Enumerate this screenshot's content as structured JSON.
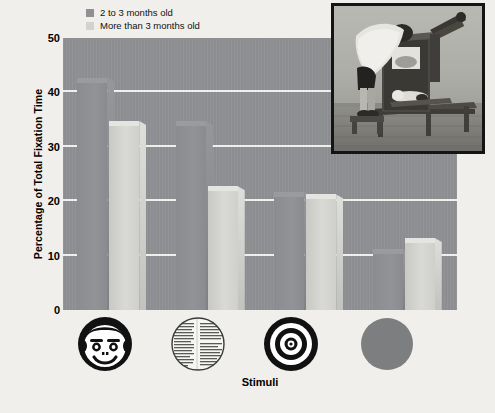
{
  "figure": {
    "background_color": "#f0efeb",
    "plot_background_color": "#8f9093"
  },
  "legend": {
    "position": "top-left-inside",
    "entries": [
      {
        "label": "2 to 3 months old",
        "color": "#8f9093",
        "swatch": "dark"
      },
      {
        "label": "More than 3 months old",
        "color": "#d2d2ce",
        "swatch": "light"
      }
    ]
  },
  "axes": {
    "ylabel": "Percentage of Total Fixation Time",
    "xlabel": "Stimuli",
    "yticks": [
      "0",
      "10",
      "20",
      "30",
      "40",
      "50"
    ],
    "ymin": 0,
    "ymax": 50,
    "grid": "horizontal"
  },
  "stimuli": [
    {
      "name": "face-stimulus",
      "icon": "schematic-face-icon",
      "caption": ""
    },
    {
      "name": "newsprint-stimulus",
      "icon": "newsprint-circle-icon",
      "caption": ""
    },
    {
      "name": "bullseye-stimulus",
      "icon": "bullseye-icon",
      "caption": ""
    },
    {
      "name": "plain-disc-stimulus",
      "icon": "plain-disc-icon",
      "caption": ""
    }
  ],
  "inset": {
    "name": "fantz-looking-chamber-photo",
    "description": "Researcher leaning over an infant looking chamber",
    "border_color": "#141414"
  },
  "chart_data": {
    "type": "bar",
    "title": "",
    "xlabel": "Stimuli",
    "ylabel": "Percentage of Total Fixation Time",
    "ylim": [
      0,
      50
    ],
    "yticks": [
      0,
      10,
      20,
      30,
      40,
      50
    ],
    "grid": true,
    "legend_position": "upper left",
    "categories": [
      "Face",
      "Newsprint",
      "Bullseye",
      "Plain disc"
    ],
    "series": [
      {
        "name": "2 to 3 months old",
        "color": "#8f9093",
        "values": [
          42,
          34,
          21,
          10.5
        ]
      },
      {
        "name": "More than 3 months old",
        "color": "#d2d2ce",
        "values": [
          34,
          22,
          20.5,
          12.5
        ]
      }
    ]
  }
}
